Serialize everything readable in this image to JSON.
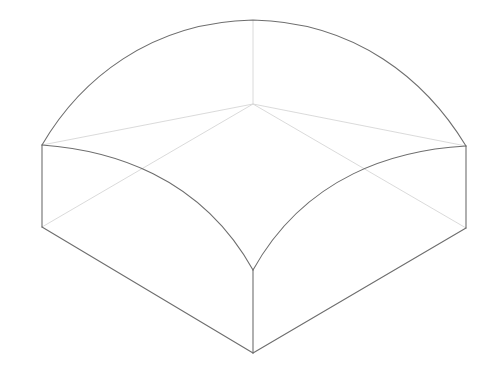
{
  "figure": {
    "background": "#ffffff",
    "colors": {
      "visible_edge": "#6e6e6e",
      "hidden_edge": "#d6d6d6"
    },
    "vertices": {
      "apex": [
        253,
        20
      ],
      "left_top": [
        42,
        145
      ],
      "right_top": [
        466,
        146
      ],
      "front_top": [
        253,
        270
      ],
      "left_bottom": [
        42,
        227
      ],
      "right_bottom": [
        466,
        228
      ],
      "front_bottom": [
        253,
        353
      ],
      "back_center": [
        253,
        104
      ]
    },
    "paths": {
      "dome_back_arc": "M42,145 C80,80 150,22 253,20 C356,22 426,80 466,146",
      "front_left_arc": "M42,145 C110,150 200,175 253,270",
      "front_right_arc": "M466,146 C396,150 306,175 253,270",
      "left_vertical": "M42,145 L42,227",
      "right_vertical": "M466,146 L466,228",
      "front_vertical": "M253,270 L253,353",
      "bottom_left": "M42,227 L253,353",
      "bottom_right": "M466,228 L253,353",
      "hidden_apex_down": "M253,20 L253,104",
      "hidden_to_left_top": "M253,104 L42,145",
      "hidden_to_right_top": "M253,104 L466,146",
      "hidden_left_bottom": "M42,227 L253,104",
      "hidden_right_bottom": "M466,228 L253,104"
    }
  }
}
